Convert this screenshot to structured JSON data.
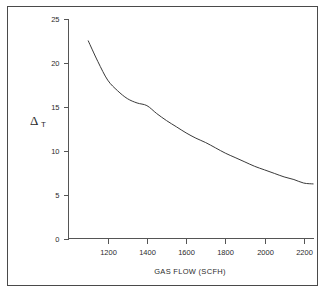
{
  "chart_data": {
    "type": "line",
    "title": "",
    "subtitle": "",
    "xlabel": "GAS FLOW (SCFH)",
    "ylabel": "ΔT",
    "ylabel_symbol": "Δ",
    "ylabel_subscript": "T",
    "xlim": [
      1000,
      2250
    ],
    "ylim": [
      0,
      25
    ],
    "xticks": [
      1200,
      1400,
      1600,
      1800,
      2000,
      2200
    ],
    "xtick_labels": [
      "1200",
      "1400",
      "1600",
      "1800",
      "2000",
      "2200"
    ],
    "yticks": [
      0,
      5,
      10,
      15,
      20,
      25
    ],
    "ytick_labels": [
      "0",
      "5",
      "10",
      "15",
      "20",
      "25"
    ],
    "grid": false,
    "legend": null,
    "legend_position": "none",
    "series": [
      {
        "name": "ΔT vs gas flow",
        "color": "#3a3a3a",
        "x": [
          1100,
          1150,
          1200,
          1250,
          1300,
          1350,
          1400,
          1450,
          1500,
          1550,
          1600,
          1650,
          1700,
          1750,
          1800,
          1850,
          1900,
          1950,
          2000,
          2050,
          2100,
          2150,
          2200,
          2250
        ],
        "y": [
          22.5,
          20.1,
          18.0,
          16.8,
          15.9,
          15.4,
          15.1,
          14.2,
          13.4,
          12.7,
          12.0,
          11.4,
          10.9,
          10.3,
          9.7,
          9.2,
          8.7,
          8.2,
          7.8,
          7.4,
          7.0,
          6.7,
          6.3,
          6.2
        ]
      }
    ],
    "annotations": []
  },
  "figure": {
    "border": true,
    "border_color": "#4a4a4a",
    "background": "#ffffff",
    "axis_color": "#555555",
    "text_color": "#2b2b2b"
  }
}
